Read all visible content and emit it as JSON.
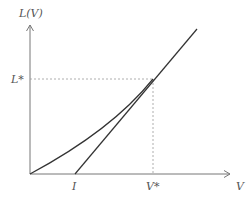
{
  "diagram": {
    "y_axis_label": "L(V)",
    "x_axis_label": "V",
    "y_marker_label": "L*",
    "x_marker_label": "V*",
    "x_intercept_label": "I",
    "colors": {
      "axis": "#777777",
      "curve": "#333333",
      "guide": "#999999",
      "text": "#555555"
    }
  }
}
